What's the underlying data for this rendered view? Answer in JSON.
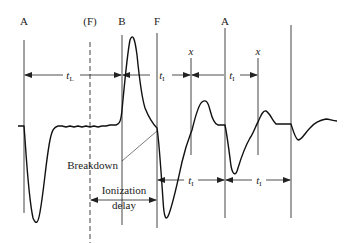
{
  "diagram": {
    "colors": {
      "ink": "#222222",
      "line": "#444444",
      "background": "#ffffff"
    },
    "top_labels": [
      {
        "id": "A1",
        "text": "A",
        "x": 24
      },
      {
        "id": "F_dashed",
        "text": "(F)",
        "x": 90
      },
      {
        "id": "B",
        "text": "B",
        "x": 122
      },
      {
        "id": "F",
        "text": "F",
        "x": 157
      },
      {
        "id": "A2",
        "text": "A",
        "x": 225
      }
    ],
    "x_labels": [
      {
        "text": "x",
        "x": 191
      },
      {
        "text": "x",
        "x": 258
      }
    ],
    "interval_labels": {
      "tL": {
        "main": "t",
        "sub": "L"
      },
      "tI_1": {
        "main": "t",
        "sub": "I"
      },
      "tI_2": {
        "main": "t",
        "sub": "I"
      },
      "tI_3": {
        "main": "t",
        "sub": "I"
      },
      "tI_4": {
        "main": "t",
        "sub": "I"
      }
    },
    "annotations": {
      "breakdown": "Breakdown",
      "ionization_line1": "Ionization",
      "ionization_line2": "delay"
    }
  }
}
